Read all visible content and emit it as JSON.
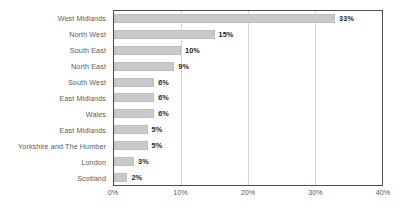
{
  "chart_data": {
    "type": "bar",
    "orientation": "horizontal",
    "title": "",
    "xlabel": "",
    "ylabel": "",
    "categories": [
      "West Midlands",
      "North West",
      "South East",
      "North East",
      "South West",
      "East Midlands",
      "Wales",
      "East Midlands",
      "Yorkshire and The Humber",
      "London",
      "Scotland"
    ],
    "values": [
      33,
      15,
      10,
      9,
      6,
      6,
      6,
      5,
      5,
      3,
      2
    ],
    "value_labels": [
      "33%",
      "15%",
      "10%",
      "9%",
      "6%",
      "6%",
      "6%",
      "5%",
      "5%",
      "3%",
      "2%"
    ],
    "xlim": [
      0,
      40
    ],
    "xticks": [
      0,
      10,
      20,
      30,
      40
    ],
    "xtick_labels": [
      "0%",
      "10%",
      "20%",
      "30%",
      "40%"
    ],
    "gridlines": {
      "vertical": true,
      "horizontal": false
    },
    "legend": null,
    "bar_color": "#c9c9c9",
    "bar_border_color": "#bdbdbd",
    "plot_border_color": "#4c4c4c",
    "gridline_color": "#d4d4d4",
    "label_color": "#5a5a5a",
    "value_label_color": "#1f1f1f",
    "background_color": "#ffffff"
  }
}
